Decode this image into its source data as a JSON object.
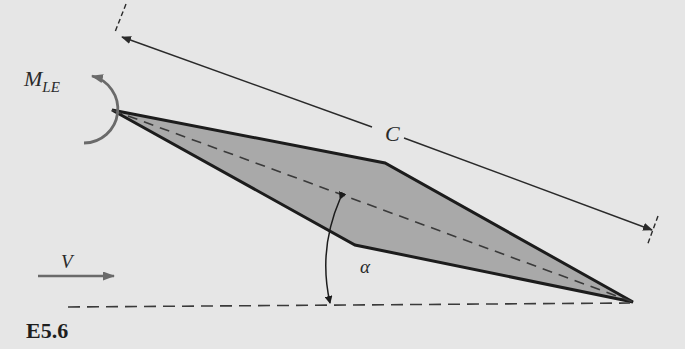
{
  "figure": {
    "id_label": "E5.6"
  },
  "labels": {
    "moment_main": "M",
    "moment_sub": "LE",
    "chord": "C",
    "velocity": "V",
    "angle": "α"
  },
  "geometry": {
    "leading_edge": [
      112,
      110
    ],
    "upper_vertex": [
      385,
      163
    ],
    "trailing_edge": [
      633,
      302
    ],
    "lower_vertex": [
      355,
      245
    ],
    "freestream_line_y": 306
  },
  "colors": {
    "background": "#e6e6e6",
    "airfoil_fill": "#a9a9a9",
    "outline": "#1c1c1c",
    "annotation": "#5a5a5a"
  }
}
